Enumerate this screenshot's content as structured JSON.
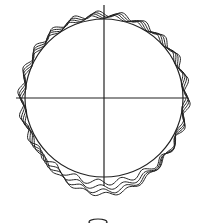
{
  "diagram": {
    "title": "",
    "stroke_color": "#222222",
    "background": "#ffffff",
    "reference_circle": {
      "cx": 104,
      "cy": 98,
      "r": 79
    },
    "crosshair": {
      "horizontal": {
        "x1": 16,
        "x2": 186,
        "y": 98
      },
      "vertical": {
        "x": 104,
        "y1": 5,
        "y2": 186
      }
    },
    "profiles": [
      {
        "name": "profile-1",
        "cy_offset": 0,
        "amplitude": 3,
        "lobes": 22,
        "r": 86
      },
      {
        "name": "profile-2",
        "cy_offset": 6,
        "amplitude": 2.5,
        "lobes": 22,
        "r": 85
      },
      {
        "name": "profile-3",
        "cy_offset": 11,
        "amplitude": 2.5,
        "lobes": 22,
        "r": 84
      },
      {
        "name": "profile-4",
        "cy_offset": 15,
        "amplitude": 2,
        "lobes": 22,
        "r": 83
      }
    ],
    "bottom_mark": {
      "cx": 98,
      "cy": 222,
      "rx": 9,
      "ry": 3
    }
  }
}
